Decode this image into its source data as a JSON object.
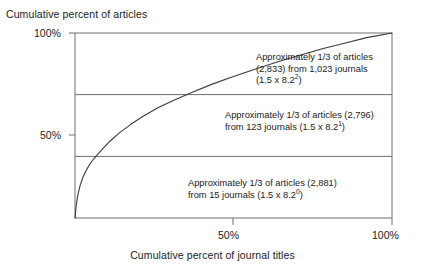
{
  "chart_data": {
    "type": "line",
    "title": "",
    "ylabel": "Cumulative percent of articles",
    "xlabel": "Cumulative percent of journal titles",
    "xlim": [
      0,
      100
    ],
    "ylim": [
      0,
      100
    ],
    "grid": false,
    "x_ticks": [
      {
        "value": 50,
        "label": "50%"
      },
      {
        "value": 100,
        "label": "100%"
      }
    ],
    "y_ticks": [
      {
        "value": 50,
        "label": "50%"
      },
      {
        "value": 100,
        "label": "100%"
      }
    ],
    "series": [
      {
        "name": "Cumulative distribution of articles over journal titles",
        "x": [
          0.0,
          0.4,
          0.9,
          1.6,
          2.5,
          3.6,
          5.0,
          6.6,
          8.5,
          11.0,
          14.0,
          17.5,
          21.5,
          26.0,
          31.0,
          37.0,
          43.5,
          50.0,
          57.0,
          64.0,
          71.0,
          78.0,
          85.0,
          92.0,
          100.0
        ],
        "y": [
          0.0,
          7.0,
          12.5,
          17.5,
          22.0,
          26.0,
          30.0,
          33.3,
          37.0,
          41.5,
          46.0,
          50.5,
          55.0,
          59.5,
          63.5,
          68.0,
          72.5,
          76.5,
          80.5,
          84.5,
          88.0,
          91.5,
          94.5,
          97.5,
          100.0
        ]
      }
    ],
    "zone_boundaries": [
      {
        "value": 33.3,
        "label": ""
      },
      {
        "value": 66.7,
        "label": ""
      }
    ],
    "annotations": [
      {
        "id": "zone-3",
        "line1": "Approximately 1/3 of articles",
        "line2": "(2,833) from 1,023 journals",
        "line3_prefix": "(1.5 x 8.2",
        "line3_exponent": "2",
        "line3_suffix": ")",
        "articles": 2833,
        "journals": 1023
      },
      {
        "id": "zone-2",
        "line1": "Approximately 1/3 of articles (2,796)",
        "line2_prefix": "from 123 journals (1.5 x 8.2",
        "line2_exponent": "1",
        "line2_suffix": ")",
        "articles": 2796,
        "journals": 123
      },
      {
        "id": "zone-1",
        "line1": "Approximately 1/3 of articles (2,881)",
        "line2_prefix": "from 15 journals (1.5 x 8.2",
        "line2_exponent": "0",
        "line2_suffix": ")",
        "articles": 2881,
        "journals": 15
      }
    ],
    "colors": {
      "curve": "#3a3a3a",
      "frame": "#6e6e6e",
      "divider": "#6e6e6e",
      "text": "#1a1a1a",
      "background": "#ffffff"
    }
  }
}
